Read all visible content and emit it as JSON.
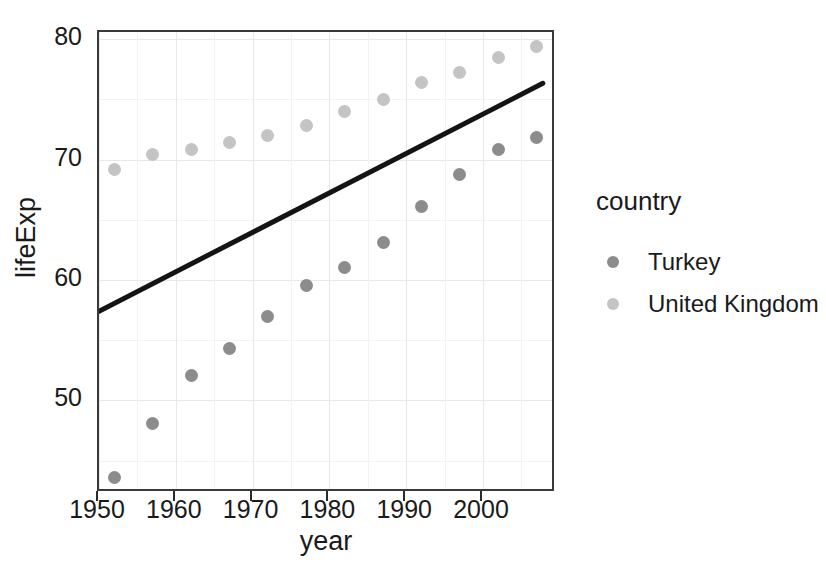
{
  "chart_data": {
    "type": "scatter",
    "title": "",
    "xlabel": "year",
    "ylabel": "lifeExp",
    "xlim": [
      1950.0,
      2009.5
    ],
    "ylim": [
      42.3,
      80.6
    ],
    "xticks": [
      "1950",
      "1960",
      "1970",
      "1980",
      "1990",
      "2000"
    ],
    "xtick_values": [
      1950,
      1960,
      1970,
      1980,
      1990,
      2000
    ],
    "yticks": [
      "50",
      "60",
      "70",
      "80"
    ],
    "ytick_values": [
      50,
      60,
      70,
      80
    ],
    "grid": true,
    "legend_position": "right",
    "legend_title": "country",
    "x": [
      1952,
      1957,
      1962,
      1967,
      1972,
      1977,
      1982,
      1987,
      1992,
      1997,
      2002,
      2007
    ],
    "series": [
      {
        "name": "Turkey",
        "color": "#8c8c8c",
        "values": [
          43.6,
          48.1,
          52.1,
          54.3,
          57.0,
          59.5,
          61.0,
          63.1,
          66.1,
          68.8,
          70.8,
          71.8
        ]
      },
      {
        "name": "United Kingdom",
        "color": "#c4c4c4",
        "values": [
          69.2,
          70.4,
          70.8,
          71.4,
          72.0,
          72.8,
          74.0,
          75.0,
          76.4,
          77.2,
          78.5,
          79.4
        ]
      }
    ],
    "annotations": [
      {
        "type": "trend-line",
        "name": "linear-fit-line",
        "color": "#141414",
        "x_start": 1950.0,
        "y_start": 57.2,
        "x_end": 2008.3,
        "y_end": 76.3
      }
    ]
  },
  "legend": {
    "title": "country",
    "entries": [
      {
        "label": "Turkey",
        "color": "#8c8c8c",
        "key_name": "legend-key-turkey"
      },
      {
        "label": "United Kingdom",
        "color": "#c4c4c4",
        "key_name": "legend-key-united-kingdom"
      }
    ]
  },
  "axes": {
    "x_title": "year",
    "y_title": "lifeExp"
  }
}
